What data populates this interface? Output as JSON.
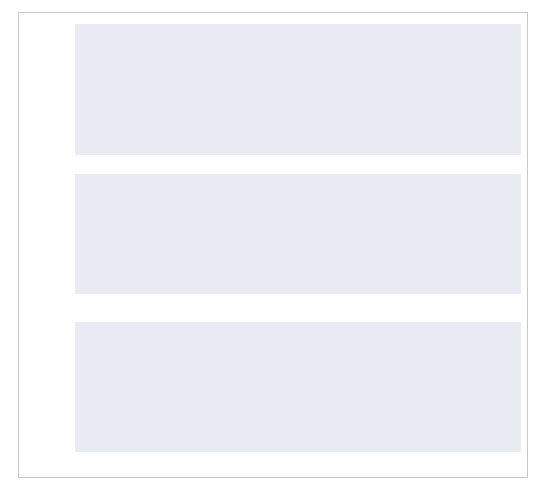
{
  "figure": {
    "background": "#ffffff",
    "plot_background": "#eaeaf2",
    "border_color": "#c8c8c8",
    "line_color": "#46637f",
    "marker_color": "#4a6b8a",
    "bar_color": "#4d4d4d"
  },
  "legend": {
    "position": "upper right",
    "entries": [
      {
        "label": "market quotes",
        "kind": "line"
      },
      {
        "label": "model values",
        "kind": "marker"
      }
    ]
  },
  "chart_data": [
    {
      "type": "line",
      "panel": "top",
      "title": "",
      "xlabel": "",
      "ylabel": "option values",
      "xlim": [
        12000,
        13050
      ],
      "ylim": [
        85,
        670
      ],
      "yticks": [
        100,
        200,
        300,
        400,
        500,
        600
      ],
      "ytick_labels": [
        "100",
        "200",
        "300",
        "400",
        "500",
        "600"
      ],
      "xticks": [
        12000,
        12200,
        12400,
        12600,
        12800,
        13000
      ],
      "xtick_labels": [],
      "grid": true,
      "x": [
        12050,
        12097,
        12145,
        12192,
        12240,
        12287,
        12335,
        12382,
        12430,
        12477,
        12525,
        12572,
        12620,
        12667,
        12715,
        12762,
        12810,
        12857,
        12905,
        12952,
        13000
      ],
      "series": [
        {
          "name": "market quotes",
          "kind": "line",
          "values": [
            645,
            608,
            570,
            530,
            494,
            458,
            424,
            391,
            360,
            330,
            302,
            275,
            249,
            225,
            202,
            181,
            161,
            143,
            127,
            113,
            113
          ]
        },
        {
          "name": "model values",
          "kind": "marker",
          "values": [
            645,
            608,
            570,
            530,
            494,
            458,
            424,
            391,
            360,
            330,
            302,
            275,
            249,
            225,
            202,
            181,
            161,
            143,
            127,
            113,
            113
          ]
        }
      ]
    },
    {
      "type": "bar",
      "panel": "middle",
      "title": "",
      "xlabel": "",
      "ylabel": "errors [EUR]",
      "xlim": [
        12000,
        13050
      ],
      "ylim": [
        -3.0,
        5.6
      ],
      "yticks": [
        -2,
        0,
        2,
        4
      ],
      "ytick_labels": [
        "−2",
        "0",
        "2",
        "4"
      ],
      "xticks": [
        12000,
        12200,
        12400,
        12600,
        12800,
        13000
      ],
      "xtick_labels": [],
      "grid": true,
      "categories": [
        12050,
        12097,
        12145,
        12192,
        12240,
        12287,
        12335,
        12382,
        12430,
        12477,
        12525,
        12572,
        12620,
        12667,
        12715,
        12762,
        12810,
        12857,
        12905,
        12952,
        13000
      ],
      "values": [
        4.75,
        2.95,
        1.3,
        0.18,
        -0.6,
        -1.55,
        -2.15,
        -2.35,
        -2.55,
        -2.5,
        -2.6,
        -2.45,
        -2.2,
        -1.7,
        -0.5,
        0.35,
        1.8,
        3.25,
        4.4,
        5.25,
        5.25
      ]
    },
    {
      "type": "bar",
      "panel": "bottom",
      "title": "",
      "xlabel": "strikes",
      "ylabel": "errors [%]",
      "xlim": [
        12000,
        13050
      ],
      "ylim": [
        -1.25,
        5.35
      ],
      "yticks": [
        -1,
        0,
        1,
        2,
        3,
        4,
        5
      ],
      "ytick_labels": [
        "−1",
        "0",
        "1",
        "2",
        "3",
        "4",
        "5"
      ],
      "xticks": [
        12000,
        12200,
        12400,
        12600,
        12800,
        13000
      ],
      "xtick_labels": [
        "12000",
        "12200",
        "12400",
        "12600",
        "12800",
        "13000"
      ],
      "grid": true,
      "categories": [
        12050,
        12097,
        12145,
        12192,
        12240,
        12287,
        12335,
        12382,
        12430,
        12477,
        12525,
        12572,
        12620,
        12667,
        12715,
        12762,
        12810,
        12857,
        12905,
        12952,
        13000
      ],
      "values": [
        0.72,
        0.45,
        0.2,
        0.03,
        -0.12,
        -0.33,
        -0.5,
        -0.6,
        -0.72,
        -0.76,
        -0.86,
        -0.85,
        -0.82,
        -0.66,
        -0.28,
        0.18,
        1.1,
        2.28,
        3.5,
        4.9,
        4.9
      ]
    }
  ]
}
